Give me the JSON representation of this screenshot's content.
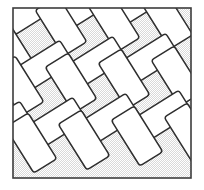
{
  "figure": {
    "canvas": {
      "width": 204,
      "height": 190
    },
    "background_color": "#ffffff"
  },
  "frame": {
    "name": "outer frame",
    "x": 13,
    "y": 8,
    "width": 178,
    "height": 170,
    "stroke_color": "#3c3c3c",
    "stroke_width": 1.6,
    "fill_color": "#d9d9d9"
  },
  "ground": {
    "name": "stippled ground",
    "base_color": "#d9d9d9",
    "stipple_color": "#ffffff",
    "stipple_period": 2
  },
  "tiles": {
    "name": "rotated rectangles",
    "fill_color": "#ffffff",
    "stroke_color": "#2e2e2e",
    "stroke_width": 1.5,
    "corner_radius": 3,
    "tile_width": 54,
    "tile_height": 27,
    "angle_a": -32,
    "angle_b": 58,
    "count": 22,
    "items": [
      {
        "cx": 31,
        "cy": 9,
        "angle": -32
      },
      {
        "cx": 84,
        "cy": 5,
        "angle": -32
      },
      {
        "cx": 137,
        "cy": 2,
        "angle": -32
      },
      {
        "cx": 61,
        "cy": 26,
        "angle": 58
      },
      {
        "cx": 114,
        "cy": 22,
        "angle": 58
      },
      {
        "cx": 167,
        "cy": 19,
        "angle": 58
      },
      {
        "cx": 8,
        "cy": 47,
        "angle": 58
      },
      {
        "cx": 44,
        "cy": 66,
        "angle": -32
      },
      {
        "cx": 97,
        "cy": 62,
        "angle": -32
      },
      {
        "cx": 150,
        "cy": 59,
        "angle": -32
      },
      {
        "cx": 18,
        "cy": 86,
        "angle": 58
      },
      {
        "cx": 71,
        "cy": 83,
        "angle": 58
      },
      {
        "cx": 124,
        "cy": 79,
        "angle": 58
      },
      {
        "cx": 177,
        "cy": 76,
        "angle": 58
      },
      {
        "cx": 57,
        "cy": 123,
        "angle": -32
      },
      {
        "cx": 110,
        "cy": 119,
        "angle": -32
      },
      {
        "cx": 163,
        "cy": 116,
        "angle": -32
      },
      {
        "cx": 4,
        "cy": 127,
        "angle": -32
      },
      {
        "cx": 31,
        "cy": 143,
        "angle": 58
      },
      {
        "cx": 84,
        "cy": 140,
        "angle": 58
      },
      {
        "cx": 137,
        "cy": 136,
        "angle": 58
      },
      {
        "cx": 190,
        "cy": 133,
        "angle": 58
      }
    ]
  }
}
